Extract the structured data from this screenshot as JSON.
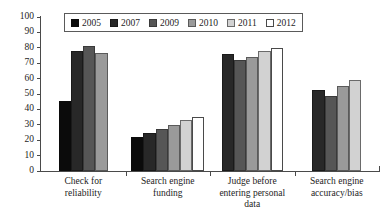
{
  "chart_data": {
    "type": "bar",
    "title": "",
    "subtitle": "",
    "xlabel": "",
    "ylabel": "",
    "ylim": [
      0,
      100
    ],
    "ytick_labels": [
      "100",
      "90",
      "80",
      "70",
      "60",
      "50",
      "40",
      "30",
      "20",
      "10",
      "0"
    ],
    "ytick_values": [
      100,
      90,
      80,
      70,
      60,
      50,
      40,
      30,
      20,
      10,
      0
    ],
    "grid": false,
    "legend_position": "top-center",
    "categories": [
      "Check for reliability",
      "Search engine funding",
      "Judge before entering personal data",
      "Search engine accuracy/bias"
    ],
    "category_label_lines": [
      [
        "Check for",
        "reliability"
      ],
      [
        "Search engine",
        "funding"
      ],
      [
        "Judge before",
        "entering personal",
        "data"
      ],
      [
        "Search engine",
        "accuracy/bias"
      ]
    ],
    "series": [
      {
        "name": "2005",
        "color": "#0b0b0b",
        "border": "#0b0b0b",
        "values": [
          45.5,
          22,
          null,
          null
        ]
      },
      {
        "name": "2007",
        "color": "#282828",
        "border": "#1a1a1a",
        "values": [
          78,
          25,
          76,
          52.5
        ]
      },
      {
        "name": "2009",
        "color": "#565656",
        "border": "#3a3a3a",
        "values": [
          81,
          27,
          72,
          48.5
        ]
      },
      {
        "name": "2010",
        "color": "#9a9a9a",
        "border": "#5a5a5a",
        "values": [
          76.5,
          30,
          74,
          55.5
        ]
      },
      {
        "name": "2011",
        "color": "#d2d2d2",
        "border": "#6a6a6a",
        "values": [
          null,
          33,
          78,
          59
        ]
      },
      {
        "name": "2012",
        "color": "#ffffff",
        "border": "#4a4a4a",
        "values": [
          null,
          35,
          80,
          null
        ]
      }
    ]
  },
  "legend": {
    "items": [
      {
        "label": "2005"
      },
      {
        "label": "2007"
      },
      {
        "label": "2009"
      },
      {
        "label": "2010"
      },
      {
        "label": "2011"
      },
      {
        "label": "2012"
      }
    ]
  }
}
